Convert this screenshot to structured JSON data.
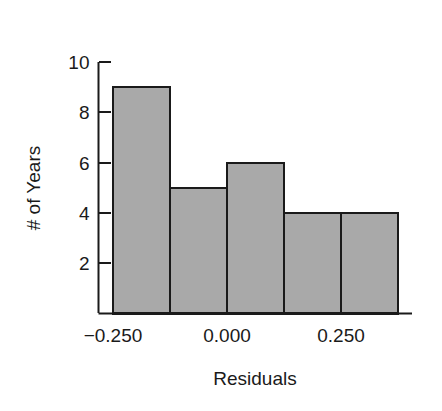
{
  "chart_data": {
    "type": "bar",
    "title": "",
    "subtitle": "",
    "xlabel": "Residuals",
    "ylabel": "# of Years",
    "histogram": true,
    "bin_edges": [
      -0.25,
      -0.125,
      0.0,
      0.125,
      0.25,
      0.375
    ],
    "categories": [
      "-0.250 to -0.125",
      "-0.125 to 0.000",
      "0.000 to 0.125",
      "0.125 to 0.250",
      "0.250 to 0.375"
    ],
    "values": [
      9,
      5,
      6,
      4,
      4
    ],
    "xlim": [
      -0.2917,
      0.4167
    ],
    "ylim": [
      0,
      10
    ],
    "xticks": [
      -0.25,
      0.0,
      0.25
    ],
    "xtick_labels": [
      "-0.250",
      "0.000",
      "0.250"
    ],
    "yticks": [
      2,
      4,
      6,
      8,
      10
    ],
    "ytick_labels": [
      "2",
      "4",
      "6",
      "8",
      "10"
    ],
    "grid": false,
    "legend": "none",
    "bar_fill_color": "#a9a9a9",
    "bar_edge_color": "#1a1a1a",
    "axis_color": "#1a1a1a",
    "background_color": "#ffffff"
  },
  "axes": {
    "y_tick_labels": [
      "10",
      "8",
      "6",
      "4",
      "2"
    ],
    "x_tick_labels": [
      "-0.250",
      "0.000",
      "0.250"
    ],
    "x_axis_title": "Residuals",
    "y_axis_title": "# of Years"
  }
}
